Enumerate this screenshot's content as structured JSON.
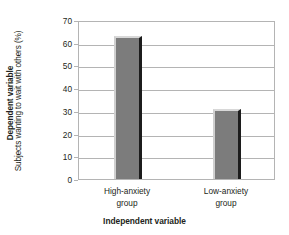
{
  "chart_data": {
    "type": "bar",
    "title": "",
    "categories": [
      "High-anxiety group",
      "Low-anxiety group"
    ],
    "category_lines": [
      [
        "High-anxiety",
        "group"
      ],
      [
        "Low-anxiety",
        "group"
      ]
    ],
    "values": [
      63,
      31
    ],
    "xlabel": "Independent variable",
    "ylabel": "Subjects wanting to wait with others (%)",
    "ylabel_outer": "Dependent variable",
    "ylim": [
      0,
      70
    ],
    "ytick_labels": [
      "70",
      "60",
      "50",
      "40",
      "30",
      "20",
      "10",
      "0"
    ],
    "ytick_values": [
      70,
      60,
      50,
      40,
      30,
      20,
      10,
      0
    ],
    "grid": "horizontal",
    "legend": "none",
    "colors": {
      "bar_fill": "#7c7c7c",
      "bar_highlight": "#d8d8d8",
      "bar_shadow": "#1c1c1c",
      "grid": "#b4b4b4",
      "frame": "#b4b4b4",
      "background": "#ffffff",
      "text": "#231f20"
    }
  }
}
